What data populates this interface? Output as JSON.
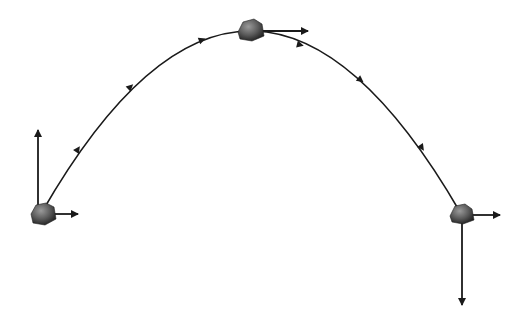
{
  "diagram": {
    "colors": {
      "background": "#ffffff",
      "path": "#1a1a1a",
      "arrow": "#1a1a1a",
      "rock_dark": "#2a2a2a",
      "rock_mid": "#6a6a6a",
      "rock_light": "#9a9a9a"
    },
    "trajectory": {
      "start": [
        42,
        212
      ],
      "peak": [
        250,
        30
      ],
      "end": [
        460,
        212
      ],
      "direction_markers": 6
    },
    "objects": [
      {
        "id": "launch",
        "position": [
          42,
          212
        ],
        "vx_arrow": "right",
        "vy_arrow": "up"
      },
      {
        "id": "apex",
        "position": [
          250,
          30
        ],
        "vx_arrow": "right",
        "vy_arrow": "none"
      },
      {
        "id": "landing",
        "position": [
          460,
          212
        ],
        "vx_arrow": "right",
        "vy_arrow": "down"
      }
    ]
  }
}
